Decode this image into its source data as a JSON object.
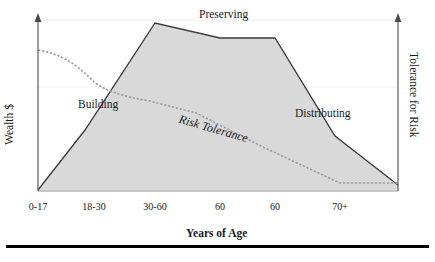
{
  "chart_data": {
    "type": "area",
    "title": "",
    "xlabel": "Years of Age",
    "ylabel": "Wealth $",
    "y2label": "Tolerance for Risk",
    "categories": [
      "0-17",
      "18-30",
      "30-60",
      "60",
      "60",
      "70+"
    ],
    "tick_positions_px": [
      38,
      94,
      155,
      220,
      275,
      340
    ],
    "grid": true,
    "gridlines_y_px": [
      20,
      87
    ],
    "legend_position": "none",
    "series": [
      {
        "name": "Wealth $",
        "style": "solid-filled-area",
        "fill_color": "#d9d9d9",
        "line_color": "#3a3a3a",
        "points_px": [
          [
            38,
            190
          ],
          [
            85,
            130
          ],
          [
            155,
            23
          ],
          [
            220,
            38
          ],
          [
            275,
            38
          ],
          [
            335,
            136
          ],
          [
            398,
            185
          ]
        ],
        "description_values": [
          0,
          18,
          100,
          95,
          95,
          50,
          15
        ]
      },
      {
        "name": "Risk Tolerance",
        "style": "dashed-line",
        "line_color": "#8a8a8a",
        "points_px": [
          [
            38,
            50
          ],
          [
            75,
            60
          ],
          [
            110,
            90
          ],
          [
            150,
            100
          ],
          [
            196,
            113
          ],
          [
            265,
            148
          ],
          [
            340,
            183
          ],
          [
            398,
            183
          ]
        ],
        "description_values": [
          82,
          76,
          58,
          52,
          44,
          24,
          4,
          4
        ]
      }
    ],
    "annotations": [
      {
        "id": "preserving",
        "text": "Preserving"
      },
      {
        "id": "building",
        "text": "Building"
      },
      {
        "id": "distributing",
        "text": "Distributing"
      },
      {
        "id": "risk_tolerance",
        "text": "Risk Tolerance"
      }
    ]
  },
  "axes": {
    "left": {
      "title": "Wealth $",
      "arrow": true
    },
    "right": {
      "title": "Tolerance for Risk",
      "arrow": true
    },
    "bottom": {
      "title": "Years of Age",
      "ticks": [
        "0-17",
        "18-30",
        "30-60",
        "60",
        "60",
        "70+"
      ]
    }
  },
  "labels": {
    "preserving": "Preserving",
    "building": "Building",
    "distributing": "Distributing",
    "risk_tolerance": "Risk Tolerance"
  },
  "colors": {
    "area_fill": "#d9d9d9",
    "wealth_line": "#3a3a3a",
    "risk_line": "#8a8a8a",
    "axis": "#5a5a5a",
    "grid": "#ececec",
    "text": "#1a1a1a",
    "rule": "#000000"
  }
}
